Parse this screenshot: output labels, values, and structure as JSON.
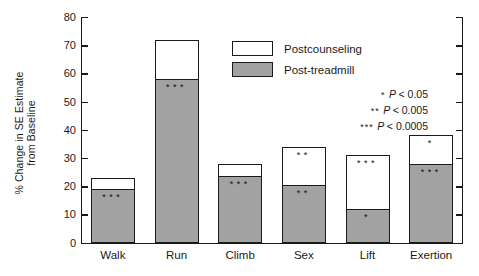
{
  "chart_data": {
    "type": "bar",
    "subtype": "stacked-bar",
    "title": "",
    "xlabel": "",
    "ylabel": "% Change in SE Estimate from Baseline",
    "ylabel_lines": [
      "% Change in SE Estimate",
      "from Baseline"
    ],
    "ylim": [
      0,
      80
    ],
    "yticks": [
      0,
      10,
      20,
      30,
      40,
      50,
      60,
      70,
      80
    ],
    "grid": false,
    "legend_position": "top-center-right",
    "categories": [
      "Walk",
      "Run",
      "Climb",
      "Sex",
      "Lift",
      "Exertion"
    ],
    "series": [
      {
        "name": "Post-treadmill",
        "color": "#a2a2a2",
        "values": [
          19,
          58,
          23.5,
          20.5,
          12,
          28
        ],
        "annotations": [
          "***",
          "***",
          "***",
          "**",
          "*",
          "***"
        ]
      },
      {
        "name": "Postcounseling",
        "color": "#ffffff",
        "values": [
          23,
          72,
          28,
          34,
          31,
          38
        ],
        "annotations": [
          "",
          "",
          "",
          "**",
          "***",
          "*"
        ]
      }
    ],
    "significance_notes": [
      {
        "stars": "*",
        "text": "P < 0.05"
      },
      {
        "stars": "**",
        "text": "P < 0.005"
      },
      {
        "stars": "***",
        "text": "P < 0.0005"
      }
    ]
  },
  "legend": {
    "items": [
      {
        "label": "Postcounseling",
        "color": "#ffffff"
      },
      {
        "label": "Post-treadmill",
        "color": "#a2a2a2"
      }
    ]
  },
  "notes": [
    {
      "stars": "*",
      "symbol": "P",
      "rest": "< 0.05"
    },
    {
      "stars": "**",
      "symbol": "P",
      "rest": "< 0.005"
    },
    {
      "stars": "***",
      "symbol": "P",
      "rest": "< 0.0005"
    }
  ]
}
